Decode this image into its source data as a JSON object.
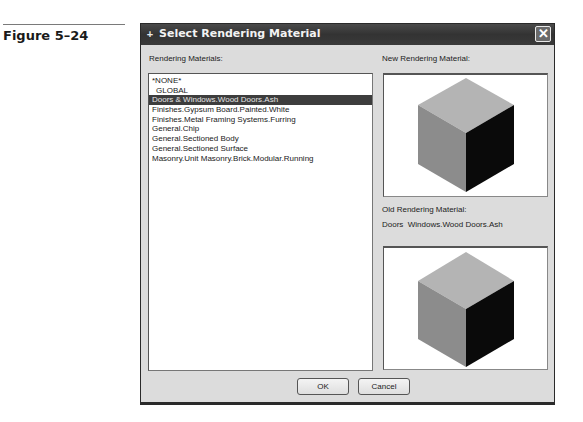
{
  "figure": {
    "label": "Figure 5–24"
  },
  "dialog": {
    "title": "Select Rendering Material",
    "title_icon": "app-icon",
    "close_icon": "close-icon",
    "list_label": "Rendering Materials:",
    "materials": [
      {
        "label": "*NONE*",
        "selected": false
      },
      {
        "label": "GLOBAL",
        "selected": false
      },
      {
        "label": "Doors & Windows.Wood Doors.Ash",
        "selected": true
      },
      {
        "label": "Finishes.Gypsum Board.Painted.White",
        "selected": false
      },
      {
        "label": "Finishes.Metal Framing Systems.Furring",
        "selected": false
      },
      {
        "label": "General.Chip",
        "selected": false
      },
      {
        "label": "General.Sectioned Body",
        "selected": false
      },
      {
        "label": "General.Sectioned Surface",
        "selected": false
      },
      {
        "label": "Masonry.Unit Masonry.Brick.Modular.Running",
        "selected": false
      }
    ],
    "new_material_label": "New Rendering Material:",
    "old_material_label": "Old Rendering Material:",
    "old_material_value": "Doors  Windows.Wood Doors.Ash",
    "buttons": {
      "ok": "OK",
      "cancel": "Cancel"
    },
    "colors": {
      "titlebar": "#3a3a3a",
      "selection": "#3d3d3d",
      "face_top": "#b4b4b4",
      "face_left": "#8c8c8c",
      "face_right": "#0a0a0a"
    }
  }
}
